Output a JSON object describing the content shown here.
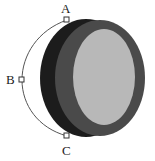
{
  "diagram": {
    "points": [
      {
        "id": "A",
        "label": "A"
      },
      {
        "id": "B",
        "label": "B"
      },
      {
        "id": "C",
        "label": "C"
      }
    ],
    "colors": {
      "side": "#1c1c1c",
      "rim": "#4a4a4a",
      "face": "#b8b8b8",
      "path": "#555555",
      "handle_fill": "#ffffff",
      "handle_stroke": "#333333"
    }
  }
}
